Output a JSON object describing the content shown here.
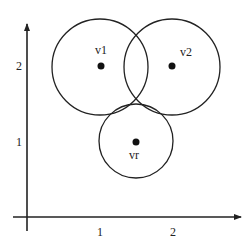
{
  "diagram": {
    "type": "coverage-circles-on-axes",
    "axes": {
      "origin": [
        27,
        217
      ],
      "x_end": [
        241,
        217
      ],
      "y_end": [
        27,
        24
      ],
      "x_start": [
        13,
        217
      ],
      "y_start": [
        27,
        231
      ],
      "x_ticks": [
        {
          "label": "1",
          "x": 100,
          "y": 233
        },
        {
          "label": "2",
          "x": 173,
          "y": 233
        }
      ],
      "y_ticks": [
        {
          "label": "2",
          "x": 19,
          "y": 67
        },
        {
          "label": "1",
          "x": 19,
          "y": 143
        }
      ]
    },
    "nodes": [
      {
        "id": "v1",
        "label": "v1",
        "cx": 100,
        "cy": 67,
        "r": 48,
        "dot": [
          101,
          66
        ],
        "label_pos": [
          101,
          51
        ],
        "label_anchor": "middle"
      },
      {
        "id": "v2",
        "label": "v2",
        "cx": 172,
        "cy": 67,
        "r": 48,
        "dot": [
          172,
          66
        ],
        "label_pos": [
          180,
          53
        ],
        "label_anchor": "start"
      },
      {
        "id": "vr",
        "label": "vr",
        "cx": 136,
        "cy": 141,
        "r": 37,
        "dot": [
          136,
          142
        ],
        "label_pos": [
          134,
          156
        ],
        "label_anchor": "middle"
      }
    ],
    "colors": {
      "stroke": "#222222",
      "dot": "#111111",
      "background": "#ffffff"
    }
  }
}
